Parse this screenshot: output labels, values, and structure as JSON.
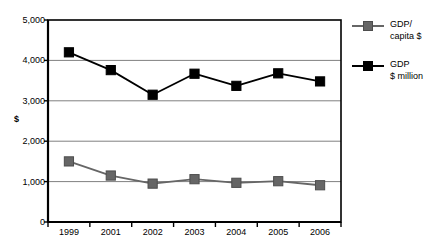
{
  "chart_data": {
    "type": "line",
    "title": "",
    "xlabel": "",
    "ylabel": "$",
    "ylim": [
      0,
      5000
    ],
    "yticks": [
      0,
      1000,
      2000,
      3000,
      4000,
      5000
    ],
    "ytick_labels": [
      "0",
      "1,000",
      "2,000",
      "3,000",
      "4,000",
      "5,000"
    ],
    "categories": [
      "1999",
      "2001",
      "2002",
      "2003",
      "2004",
      "2005",
      "2006"
    ],
    "grid": "horizontal",
    "legend_position": "right",
    "series": [
      {
        "name": "GDP/\ncapita $",
        "legend_label": "GDP/\ncapita $",
        "color": "#666666",
        "marker": "square",
        "values": [
          1500,
          1150,
          950,
          1060,
          970,
          1010,
          910
        ]
      },
      {
        "name": "GDP\n$ million",
        "legend_label": "GDP\n$ million",
        "color": "#000000",
        "marker": "square",
        "values": [
          4200,
          3760,
          3150,
          3670,
          3370,
          3680,
          3480
        ]
      }
    ]
  }
}
